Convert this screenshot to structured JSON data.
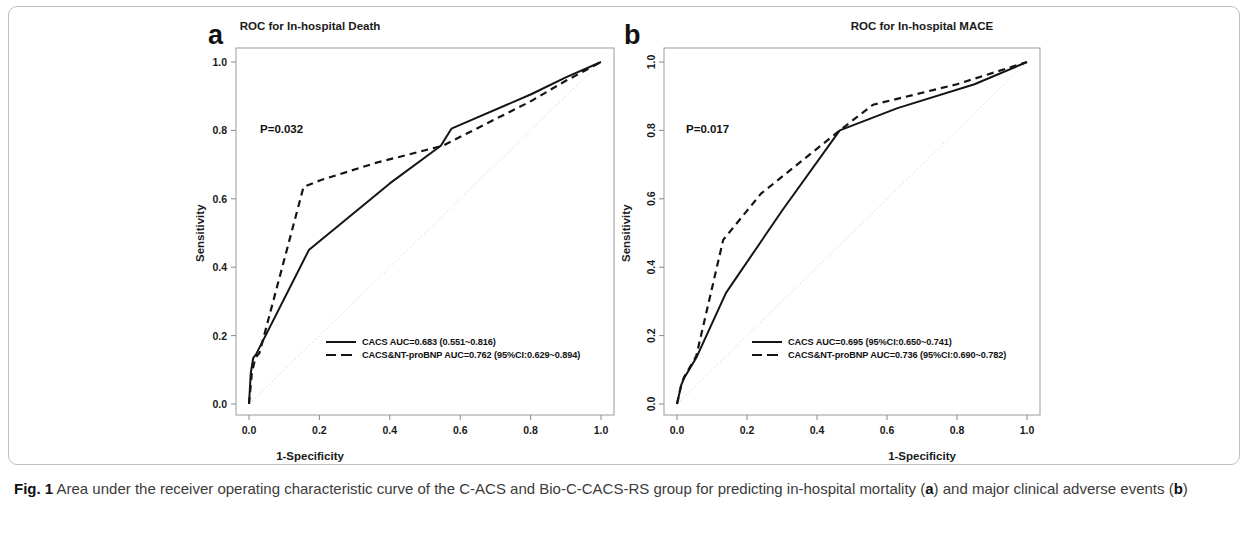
{
  "figure": {
    "caption_prefix": "Fig. 1",
    "caption_part1": " Area under the receiver operating characteristic curve of the C-ACS and Bio-C-CACS-RS group for predicting in-hospital mortality (",
    "caption_bold_a": "a",
    "caption_part2": ") and major clinical adverse events (",
    "caption_bold_b": "b",
    "caption_part3": ")"
  },
  "panels": {
    "a": {
      "letter": "a",
      "pvalue": "P=0.032",
      "legend": [
        "CACS AUC=0.683 (0.551~0.816)",
        "CACS&NT-proBNP AUC=0.762 (95%CI:0.629~0.894)"
      ]
    },
    "b": {
      "letter": "b",
      "pvalue": "P=0.017",
      "legend": [
        "CACS AUC=0.695 (95%CI:0.650~0.741)",
        "CACS&NT-proBNP AUC=0.736 (95%CI:0.690~0.782)"
      ]
    }
  },
  "chart_data": [
    {
      "panel": "a",
      "type": "line",
      "title": "ROC for In-hospital Death",
      "xlabel": "1-Specificity",
      "ylabel": "Sensitivity",
      "xlim": [
        0,
        1
      ],
      "ylim": [
        0,
        1
      ],
      "xticks": [
        "0.0",
        "0.2",
        "0.4",
        "0.6",
        "0.8",
        "1.0"
      ],
      "xtick_values": [
        0.0,
        0.2,
        0.4,
        0.6,
        0.8,
        1.0
      ],
      "yticks": [
        "0.0",
        "0.2",
        "0.4",
        "0.6",
        "0.8",
        "1.0"
      ],
      "ytick_values": [
        0.0,
        0.2,
        0.4,
        0.6,
        0.8,
        1.0
      ],
      "ytick_orientation": "horizontal",
      "grid": false,
      "annotations": [
        "P=0.032"
      ],
      "reference_line": {
        "name": "chance-diagonal",
        "x": [
          0,
          1
        ],
        "y": [
          0,
          1
        ],
        "style": "dotted",
        "color": "#d8d8d8"
      },
      "series": [
        {
          "name": "CACS",
          "label": "CACS AUC=0.683 (0.551~0.816)",
          "style": "solid",
          "color": "#141414",
          "auc": 0.683,
          "ci": [
            0.551,
            0.816
          ],
          "x": [
            0.0,
            0.005,
            0.012,
            0.02,
            0.17,
            0.4,
            0.545,
            0.575,
            0.8,
            0.9,
            1.0
          ],
          "y": [
            0.0,
            0.09,
            0.135,
            0.145,
            0.45,
            0.645,
            0.755,
            0.805,
            0.905,
            0.955,
            1.0
          ]
        },
        {
          "name": "CACS&NT-proBNP",
          "label": "CACS&NT-proBNP AUC=0.762 (95%CI:0.629~0.894)",
          "style": "dashed",
          "color": "#141414",
          "auc": 0.762,
          "ci": [
            0.629,
            0.894
          ],
          "x": [
            0.0,
            0.008,
            0.018,
            0.03,
            0.155,
            0.205,
            0.36,
            0.55,
            0.8,
            0.9,
            1.0
          ],
          "y": [
            0.0,
            0.09,
            0.135,
            0.15,
            0.635,
            0.655,
            0.705,
            0.755,
            0.885,
            0.945,
            1.0
          ]
        }
      ]
    },
    {
      "panel": "b",
      "type": "line",
      "title": "ROC for In-hospital MACE",
      "xlabel": "1-Specificity",
      "ylabel": "Sensitivity",
      "xlim": [
        0,
        1
      ],
      "ylim": [
        0,
        1
      ],
      "xticks": [
        "0.0",
        "0.2",
        "0.4",
        "0.6",
        "0.8",
        "1.0"
      ],
      "xtick_values": [
        0.0,
        0.2,
        0.4,
        0.6,
        0.8,
        1.0
      ],
      "yticks": [
        "0.0",
        "0.2",
        "0.4",
        "0.6",
        "0.8",
        "1.0"
      ],
      "ytick_values": [
        0.0,
        0.2,
        0.4,
        0.6,
        0.8,
        1.0
      ],
      "ytick_orientation": "vertical",
      "grid": false,
      "annotations": [
        "P=0.017"
      ],
      "reference_line": {
        "name": "chance-diagonal",
        "x": [
          0,
          1
        ],
        "y": [
          0,
          1
        ],
        "style": "dotted",
        "color": "#d8d8d8"
      },
      "series": [
        {
          "name": "CACS",
          "label": "CACS AUC=0.695 (95%CI:0.650~0.741)",
          "style": "solid",
          "color": "#141414",
          "auc": 0.695,
          "ci": [
            0.65,
            0.741
          ],
          "x": [
            0.0,
            0.012,
            0.02,
            0.055,
            0.14,
            0.3,
            0.465,
            0.63,
            0.85,
            1.0
          ],
          "y": [
            0.0,
            0.055,
            0.075,
            0.135,
            0.325,
            0.565,
            0.8,
            0.865,
            0.935,
            1.0
          ]
        },
        {
          "name": "CACS&NT-proBNP",
          "label": "CACS&NT-proBNP AUC=0.736 (95%CI:0.690~0.782)",
          "style": "dashed",
          "color": "#141414",
          "auc": 0.736,
          "ci": [
            0.69,
            0.782
          ],
          "x": [
            0.0,
            0.012,
            0.02,
            0.055,
            0.132,
            0.24,
            0.465,
            0.56,
            0.8,
            1.0
          ],
          "y": [
            0.0,
            0.055,
            0.078,
            0.14,
            0.48,
            0.615,
            0.8,
            0.875,
            0.935,
            1.0
          ]
        }
      ]
    }
  ]
}
